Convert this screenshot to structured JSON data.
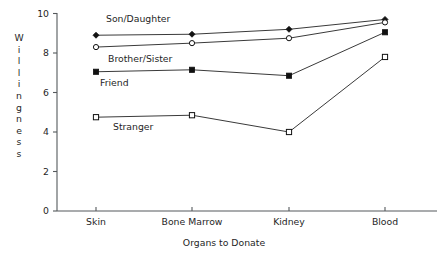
{
  "chart_data": {
    "type": "line",
    "title": "",
    "xlabel": "Organs to Donate",
    "ylabel": "Willingness",
    "categories": [
      "Skin",
      "Bone Marrow",
      "Kidney",
      "Blood"
    ],
    "ylim": [
      0,
      10
    ],
    "yticks": [
      0,
      2,
      4,
      6,
      8,
      10
    ],
    "grid": false,
    "legend_position": "inline-annotations",
    "series": [
      {
        "name": "Son/Daughter",
        "marker": "filled-diamond",
        "values": [
          8.9,
          8.95,
          9.2,
          9.7
        ]
      },
      {
        "name": "Brother/Sister",
        "marker": "open-circle",
        "values": [
          8.3,
          8.5,
          8.75,
          9.55
        ]
      },
      {
        "name": "Friend",
        "marker": "filled-square",
        "values": [
          7.05,
          7.15,
          6.85,
          9.05
        ]
      },
      {
        "name": "Stranger",
        "marker": "open-square",
        "values": [
          4.75,
          4.85,
          4.0,
          7.8
        ]
      }
    ],
    "annotations": [
      {
        "text": "Son/Daughter",
        "x": 106,
        "y": 22
      },
      {
        "text": "Brother/Sister",
        "x": 108,
        "y": 62
      },
      {
        "text": "Friend",
        "x": 100,
        "y": 86
      },
      {
        "text": "Stranger",
        "x": 113,
        "y": 130
      }
    ]
  },
  "ylabel_letters": [
    "W",
    "i",
    "l",
    "l",
    "i",
    "n",
    "g",
    "n",
    "e",
    "s",
    "s"
  ],
  "colors": {
    "line": "#3a3a3a",
    "axis": "#55595c",
    "marker_fill": "#111111",
    "marker_open": "#ffffff",
    "text": "#1f1f1f",
    "background": "#ffffff"
  }
}
